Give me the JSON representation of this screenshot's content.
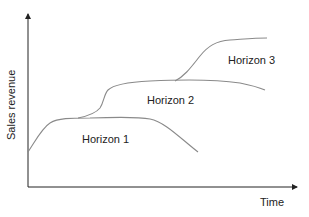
{
  "diagram": {
    "axes": {
      "x_label": "Time",
      "y_label": "Sales revenue"
    },
    "curves": [
      {
        "name": "Horizon 1",
        "label": "Horizon 1",
        "color": "#8a8a8a"
      },
      {
        "name": "Horizon 2",
        "label": "Horizon 2",
        "color": "#8a8a8a"
      },
      {
        "name": "Horizon 3",
        "label": "Horizon 3",
        "color": "#8a8a8a"
      }
    ],
    "colors": {
      "axis": "#222222",
      "curve": "#8a8a8a",
      "background": "#ffffff"
    }
  }
}
